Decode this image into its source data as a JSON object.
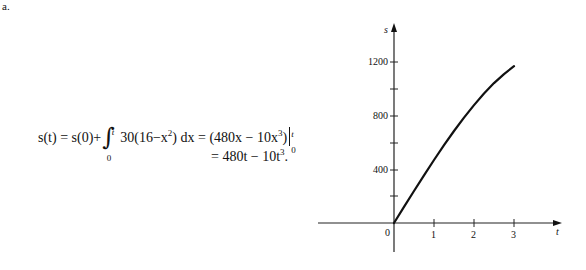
{
  "part_label": "a.",
  "equation": {
    "line1": {
      "lhs": "s(t) = s(0)+",
      "integral_upper": "t",
      "integral_lower": "0",
      "integrand": "30(16−x",
      "integrand_exp": "2",
      "integrand_close": ") dx",
      "equals": "=",
      "antiderivative": "(480x − 10x",
      "antiderivative_exp": "3",
      "antiderivative_close": ")",
      "eval_upper": "t",
      "eval_lower": "0"
    },
    "line2": {
      "text": "= 480t − 10t",
      "exp": "3",
      "tail": "."
    }
  },
  "chart_data": {
    "type": "line",
    "title": "",
    "xlabel": "t",
    "ylabel": "s",
    "function": "s(t) = 480t - 10t^3",
    "x_ticks": [
      1,
      2,
      3
    ],
    "x_tick_labels": [
      "1",
      "2",
      "3"
    ],
    "y_ticks": [
      200,
      400,
      600,
      800,
      1000,
      1200
    ],
    "y_tick_labels": [
      "400",
      "800",
      "1200"
    ],
    "y_labeled_values": [
      400,
      800,
      1200
    ],
    "origin_label": "0",
    "xlim": [
      -0.75,
      4.15
    ],
    "ylim": [
      -200,
      1470
    ],
    "grid": false,
    "series": [
      {
        "name": "s(t)",
        "x": [
          0,
          0.25,
          0.5,
          0.75,
          1,
          1.25,
          1.5,
          1.75,
          2,
          2.25,
          2.5,
          2.75,
          3
        ],
        "values": [
          0,
          119.8,
          238.75,
          355.8,
          470,
          580.5,
          686.25,
          786.4,
          880,
          966.1,
          1043.75,
          1111.0,
          1170
        ]
      }
    ]
  }
}
